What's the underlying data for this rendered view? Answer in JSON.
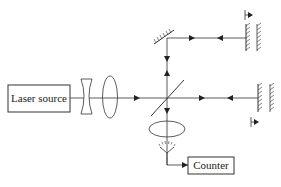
{
  "diagram": {
    "components": {
      "laser_source": {
        "label": "Laser source"
      },
      "counter": {
        "label": "Counter"
      },
      "concave_lens": {
        "type": "diverging lens"
      },
      "convex_lens": {
        "type": "converging lens"
      },
      "beam_splitter": {
        "type": "beam splitter"
      },
      "top_mirror": {
        "type": "fixed mirror"
      },
      "movable_mirror_top": {
        "type": "movable mirror with translation arrow"
      },
      "movable_mirror_right": {
        "type": "movable mirror with translation arrow"
      },
      "focusing_lens": {
        "type": "converging lens"
      },
      "detector": {
        "type": "photodetector"
      }
    },
    "colors": {
      "line": "#333333",
      "background": "#ffffff"
    }
  }
}
